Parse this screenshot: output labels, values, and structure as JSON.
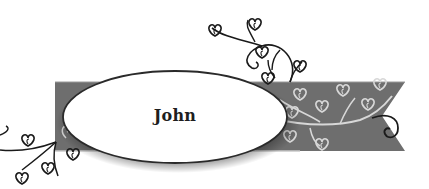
{
  "label": {
    "name": "John"
  },
  "colors": {
    "background": "#ffffff",
    "ribbon": "#6e6e6e",
    "ribbon_highlight": "#d0d0d0",
    "vine_dark": "#1a1a1a",
    "vine_light": "#d8d8d8",
    "oval_fill": "#ffffff",
    "oval_border": "#2a2a2a"
  },
  "decorations": {
    "ribbon_icon": "ribbon-banner",
    "oval_icon": "oval-name-plate",
    "vine_icons": [
      "heart-leaf-vine-top",
      "heart-leaf-vine-left",
      "heart-leaf-vine-right"
    ]
  }
}
